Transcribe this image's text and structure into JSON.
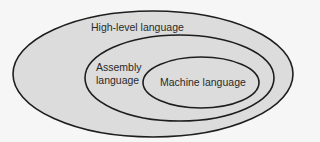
{
  "diagram": {
    "type": "nested-venn",
    "colors": {
      "background": "#f6f6f6",
      "fill": "#dcdcdc",
      "stroke": "#1e1e1e",
      "text": "#2a2a2a"
    },
    "sets": [
      {
        "id": "high-level",
        "label": "High-level language",
        "contains": [
          "assembly"
        ]
      },
      {
        "id": "assembly",
        "label_lines": [
          "Assembly",
          "language"
        ],
        "contains": [
          "machine"
        ]
      },
      {
        "id": "machine",
        "label": "Machine language",
        "contains": []
      }
    ]
  }
}
